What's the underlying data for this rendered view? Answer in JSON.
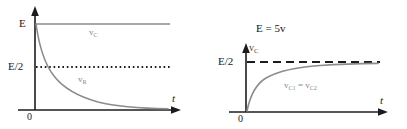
{
  "figure": {
    "background_color": "#ffffff",
    "axis_color": "#1c1c1c",
    "curve_color": "#8c8c8c",
    "flat_line_color": "#8c8c8c",
    "dotted_line_color": "#1c1c1c",
    "dashed_line_color": "#1c1c1c",
    "width": 407,
    "height": 129
  },
  "charts": [
    {
      "id": "discharge",
      "type": "line",
      "title": "",
      "xlabel": "t",
      "ylabel": "",
      "origin_label": "0",
      "y_ticks": [
        {
          "label": "E",
          "value": 1.0
        },
        {
          "label": "E/2",
          "value": 0.5
        }
      ],
      "xlim": [
        0,
        10
      ],
      "ylim": [
        0,
        1.15
      ],
      "grid": false,
      "legend_position": "inline",
      "series": [
        {
          "name": "v_C",
          "label_html": "v<span class=\"sub\">C</span>",
          "style": "solid",
          "color": "#8c8c8c",
          "description": "constant at E",
          "x": [
            0,
            1,
            2,
            3,
            4,
            5,
            6,
            7,
            8,
            9,
            10
          ],
          "values": [
            1.0,
            1.0,
            1.0,
            1.0,
            1.0,
            1.0,
            1.0,
            1.0,
            1.0,
            1.0,
            1.0
          ]
        },
        {
          "name": "v_R",
          "label_html": "v<span class=\"sub\">R</span>",
          "style": "solid",
          "color": "#8c8c8c",
          "description": "exponential decay from E to 0",
          "x": [
            0,
            0.5,
            1,
            1.5,
            2,
            2.5,
            3,
            4,
            5,
            6,
            7,
            8,
            9,
            10
          ],
          "values": [
            1.0,
            0.72,
            0.52,
            0.39,
            0.3,
            0.24,
            0.19,
            0.13,
            0.1,
            0.08,
            0.066,
            0.056,
            0.05,
            0.045
          ]
        },
        {
          "name": "E/2-level",
          "label_html": "",
          "style": "dotted",
          "color": "#1c1c1c",
          "description": "horizontal reference at E/2",
          "x": [
            0,
            10
          ],
          "values": [
            0.5,
            0.5
          ]
        }
      ]
    },
    {
      "id": "charge",
      "type": "line",
      "title": "E = 5v",
      "xlabel": "t",
      "ylabel_html": "v<span class=\"sub\">C</span>",
      "ylabel": "v_C",
      "origin_label": "0",
      "y_ticks": [
        {
          "label": "E/2",
          "value": 0.5
        }
      ],
      "xlim": [
        0,
        10
      ],
      "ylim": [
        0,
        0.78
      ],
      "grid": false,
      "legend_position": "inline",
      "series": [
        {
          "name": "v_C1 = v_C2",
          "label_html": "v<span class=\"sub\">C1</span> = v<span class=\"sub\">C2</span>",
          "style": "solid",
          "color": "#8c8c8c",
          "description": "exponential rise toward E/2",
          "x": [
            0,
            0.3,
            0.6,
            1,
            1.5,
            2,
            2.5,
            3,
            4,
            5,
            6,
            7,
            8,
            9,
            10
          ],
          "values": [
            0.0,
            0.16,
            0.26,
            0.34,
            0.4,
            0.43,
            0.451,
            0.464,
            0.478,
            0.486,
            0.49,
            0.492,
            0.494,
            0.496,
            0.497
          ]
        },
        {
          "name": "E/2-level",
          "label_html": "",
          "style": "dashed",
          "color": "#1c1c1c",
          "description": "horizontal asymptote at E/2",
          "x": [
            0,
            10
          ],
          "values": [
            0.5,
            0.5
          ]
        }
      ]
    }
  ],
  "chart_data": [
    {
      "type": "line",
      "title": "",
      "xlabel": "t",
      "ylabel": "",
      "xlim": [
        0,
        10
      ],
      "ylim": [
        0,
        1.15
      ],
      "grid": false,
      "legend_position": "inline",
      "tick_labels": {
        "y": [
          "E",
          "E/2",
          "0"
        ],
        "x": [
          "0"
        ]
      },
      "annotations": [
        "v_C",
        "v_R",
        "E/2 dotted reference line"
      ],
      "x": [
        0,
        0.5,
        1,
        1.5,
        2,
        2.5,
        3,
        4,
        5,
        6,
        7,
        8,
        9,
        10
      ],
      "series": [
        {
          "name": "v_C",
          "values": [
            1.0,
            1.0,
            1.0,
            1.0,
            1.0,
            1.0,
            1.0,
            1.0,
            1.0,
            1.0,
            1.0,
            1.0,
            1.0,
            1.0
          ]
        },
        {
          "name": "v_R",
          "values": [
            1.0,
            0.72,
            0.52,
            0.39,
            0.3,
            0.24,
            0.19,
            0.13,
            0.1,
            0.08,
            0.066,
            0.056,
            0.05,
            0.045
          ]
        },
        {
          "name": "E/2",
          "values": [
            0.5,
            0.5,
            0.5,
            0.5,
            0.5,
            0.5,
            0.5,
            0.5,
            0.5,
            0.5,
            0.5,
            0.5,
            0.5,
            0.5
          ]
        }
      ]
    },
    {
      "type": "line",
      "title": "E = 5v",
      "xlabel": "t",
      "ylabel": "v_C",
      "xlim": [
        0,
        10
      ],
      "ylim": [
        0,
        0.78
      ],
      "grid": false,
      "legend_position": "inline",
      "tick_labels": {
        "y": [
          "E/2",
          "0"
        ],
        "x": [
          "0"
        ]
      },
      "annotations": [
        "v_C1 = v_C2",
        "E/2 dashed asymptote"
      ],
      "x": [
        0,
        0.3,
        0.6,
        1,
        1.5,
        2,
        2.5,
        3,
        4,
        5,
        6,
        7,
        8,
        9,
        10
      ],
      "series": [
        {
          "name": "v_C1 = v_C2",
          "values": [
            0.0,
            0.16,
            0.26,
            0.34,
            0.4,
            0.43,
            0.451,
            0.464,
            0.478,
            0.486,
            0.49,
            0.492,
            0.494,
            0.496,
            0.497
          ]
        },
        {
          "name": "E/2",
          "values": [
            0.5,
            0.5,
            0.5,
            0.5,
            0.5,
            0.5,
            0.5,
            0.5,
            0.5,
            0.5,
            0.5,
            0.5,
            0.5,
            0.5
          ]
        }
      ]
    }
  ]
}
